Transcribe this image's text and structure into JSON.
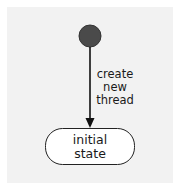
{
  "diagram": {
    "type": "state-machine",
    "initial_node": {
      "kind": "pseudostate-initial",
      "fill": "#4a4a4a"
    },
    "transition": {
      "label_lines": [
        "create",
        "new",
        "thread"
      ]
    },
    "state": {
      "label_lines": [
        "initial",
        "state"
      ]
    }
  }
}
